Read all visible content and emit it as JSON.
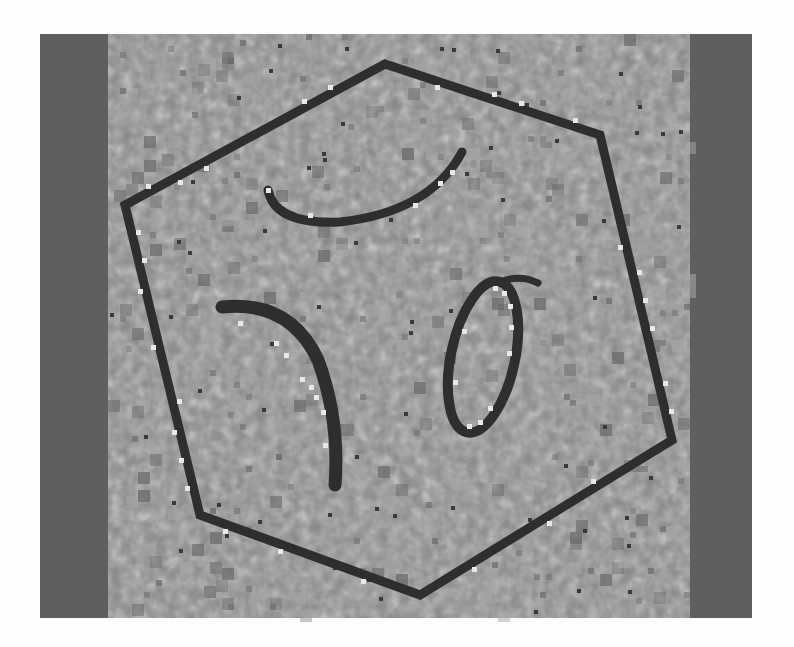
{
  "image": {
    "description": "Grayscale pixelated noisy image of a dark hexagon outline containing three curved strokes",
    "colors": {
      "page_background": "#fdfdfd",
      "side_band": "#5f5f5f",
      "texture_base": "#858585",
      "texture_light": "#a5a5a5",
      "texture_dark": "#6a6a6a",
      "stroke": "#2e2e2e",
      "highlight": "#e8e8e8",
      "speck": "#3a3a3a"
    },
    "frame": {
      "x": 40,
      "y": 34,
      "width": 712,
      "height": 584
    },
    "bands": {
      "left": {
        "x": 40,
        "width": 68
      },
      "right": {
        "x": 690,
        "width": 62
      }
    },
    "shapes": {
      "hexagon": {
        "label": "hexagon-outline",
        "vertices": [
          [
            385,
            64
          ],
          [
            600,
            135
          ],
          [
            672,
            440
          ],
          [
            420,
            595
          ],
          [
            200,
            515
          ],
          [
            125,
            205
          ]
        ]
      },
      "top_arc": {
        "label": "crescent-arc",
        "path": "M 268 190 Q 275 225 340 222 Q 430 212 462 152"
      },
      "left_stroke": {
        "label": "curved-stroke",
        "path": "M 222 307 Q 290 300 318 360 Q 340 420 335 485"
      },
      "right_loop": {
        "label": "ellipse-loop",
        "cx": 483,
        "cy": 357,
        "rx": 32,
        "ry": 77,
        "rotation": 12
      }
    }
  }
}
